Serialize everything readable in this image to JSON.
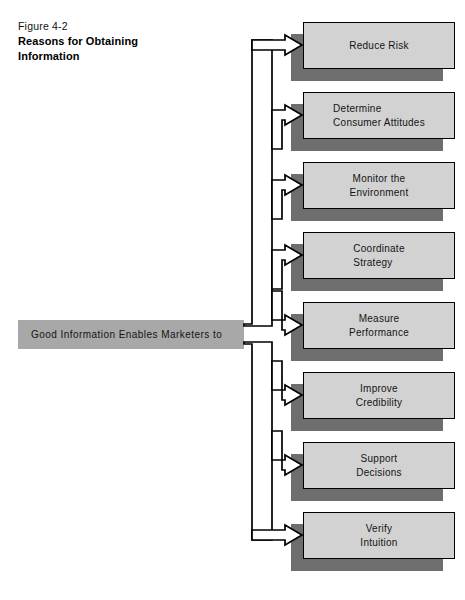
{
  "figure": {
    "label": "Figure 4-2",
    "title": "Reasons for Obtaining\nInformation"
  },
  "colors": {
    "node_fill": "#d2d2d2",
    "node_border": "#000000",
    "node_shadow": "#6e6e6e",
    "source_fill": "#a8a8a8",
    "arrow_fill": "#ffffff",
    "arrow_stroke": "#000000",
    "page_background": "#ffffff",
    "text": "#141414"
  },
  "source": {
    "label": "Good Information Enables Marketers to"
  },
  "diagram": {
    "type": "branching-flowchart",
    "orientation": "left-to-right",
    "branch_count": 8,
    "trunk_style": "hollow-double-line",
    "arrowhead_style": "hollow-block-arrow"
  },
  "nodes": [
    {
      "id": "reduce-risk",
      "label": "Reduce Risk",
      "align": "center",
      "top": 22
    },
    {
      "id": "consumer-attitudes",
      "label": "Determine\nConsumer Attitudes",
      "align": "left",
      "top": 92
    },
    {
      "id": "monitor-environment",
      "label": "Monitor the\nEnvironment",
      "align": "center",
      "top": 162
    },
    {
      "id": "coordinate-strategy",
      "label": "Coordinate\nStrategy",
      "align": "left",
      "top": 232
    },
    {
      "id": "measure-performance",
      "label": "Measure\nPerformance",
      "align": "center",
      "top": 302
    },
    {
      "id": "improve-credibility",
      "label": "Improve\nCredibility",
      "align": "center",
      "top": 372
    },
    {
      "id": "support-decisions",
      "label": "Support\nDecisions",
      "align": "center",
      "top": 442
    },
    {
      "id": "verify-intuition",
      "label": "Verify\nIntuition",
      "align": "center",
      "top": 512
    }
  ]
}
